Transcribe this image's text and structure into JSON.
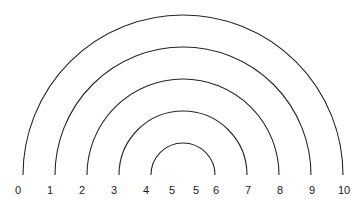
{
  "figure": {
    "name": "nested-semicircles-diagram",
    "width": 358,
    "height": 205,
    "background_color": "#ffffff"
  },
  "style": {
    "stroke_color": "#262626",
    "stroke_width": 1.1,
    "label_color": "#1a1a1a",
    "label_font_size": 11
  },
  "chart_data": {
    "type": "line",
    "title": "",
    "subtitle": "",
    "xlabel": "",
    "ylabel": "",
    "grid": false,
    "legend": null,
    "center": {
      "x": 183,
      "y": 175
    },
    "baseline_y": 175,
    "tick_spacing_px": 32,
    "arc_count": 5,
    "arcs": [
      {
        "index": 1,
        "radius": 160,
        "left_x": 23,
        "right_x": 343,
        "apex_y": 15,
        "label_left": "0",
        "label_right": "10"
      },
      {
        "index": 2,
        "radius": 128,
        "left_x": 55,
        "right_x": 311,
        "apex_y": 47,
        "label_left": "1",
        "label_right": "9"
      },
      {
        "index": 3,
        "radius": 96,
        "left_x": 87,
        "right_x": 279,
        "apex_y": 79,
        "label_left": "2",
        "label_right": "8"
      },
      {
        "index": 4,
        "radius": 64,
        "left_x": 119,
        "right_x": 247,
        "apex_y": 111,
        "label_left": "3",
        "label_right": "7"
      },
      {
        "index": 5,
        "radius": 32,
        "left_x": 151,
        "right_x": 215,
        "apex_y": 143,
        "label_left": "4",
        "label_right": "6"
      }
    ],
    "axis": {
      "orientation": "horizontal",
      "tick_labels": [
        "0",
        "1",
        "2",
        "3",
        "4",
        "5",
        "5",
        "6",
        "7",
        "8",
        "9",
        "10"
      ],
      "tick_positions_px": [
        18,
        50,
        82,
        114,
        146,
        172,
        196,
        216,
        248,
        280,
        312,
        344
      ],
      "tick_values": [
        0,
        1,
        2,
        3,
        4,
        5,
        5,
        6,
        7,
        8,
        9,
        10
      ],
      "label_y_px": 184,
      "note": "Axis is mirrored about the center: values ascend 0 to 5 from the left edge and 5 back up to 10 toward the right, so the value 5 appears twice near the midpoint."
    }
  }
}
